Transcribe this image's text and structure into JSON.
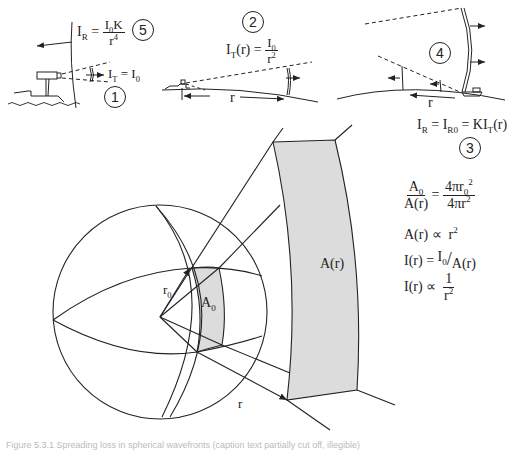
{
  "panels": {
    "p1": {
      "number": "1",
      "formula_lhs": "I",
      "formula_lhs_sub": "T",
      "formula_rhs": "I",
      "formula_rhs_sub": "0"
    },
    "p5": {
      "number": "5",
      "lhs": "I",
      "lhs_sub": "R",
      "num": "I",
      "num_sub": "0",
      "num_tail": "K",
      "den": "r",
      "den_sup": "4"
    },
    "p2": {
      "number": "2",
      "lhs": "I",
      "lhs_sub": "T",
      "lhs_arg": "(r)",
      "num": "I",
      "num_sub": "0",
      "den": "r",
      "den_sup": "2",
      "distance_label": "r"
    },
    "p4": {
      "number": "4",
      "distance_label": "r"
    },
    "p3": {
      "number": "3",
      "formula": [
        "I",
        "R",
        " = I",
        "R0",
        " = KI",
        "T",
        "(r)"
      ]
    }
  },
  "sphere": {
    "radius_label": "r",
    "radius_label_sub": "0",
    "outer_radius_label": "r",
    "small_area_label": "A",
    "small_area_sub": "0",
    "large_area_label": "A(r)",
    "fill_color": "#dcdcdc",
    "line_color": "#222222"
  },
  "equations": {
    "eq1": {
      "lhs_num": "A",
      "lhs_num_sub": "0",
      "lhs_den": "A(r)",
      "rhs_num": "4πr",
      "rhs_num_sub": "0",
      "rhs_num_sup": "2",
      "rhs_den": "4πr",
      "rhs_den_sup": "2"
    },
    "eq2": {
      "lhs": "A(r) ∝",
      "rhs": "r",
      "rhs_sup": "2"
    },
    "eq3": {
      "lhs": "I(r) =",
      "num": "I",
      "num_sub": "0",
      "slash": "/",
      "den": "A(r)"
    },
    "eq4": {
      "lhs": "I(r) ∝",
      "num": "1",
      "den": "r",
      "den_sup": "2"
    }
  },
  "caption": "Figure 5.3.1  Spreading loss in spherical wavefronts (caption text partially cut off, illegible)"
}
